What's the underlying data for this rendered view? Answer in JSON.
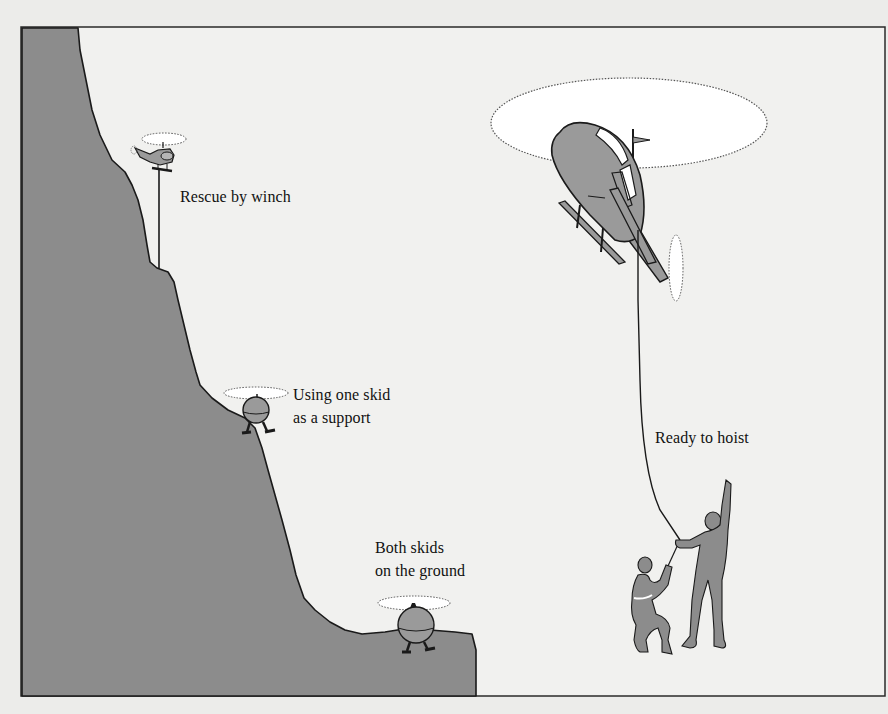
{
  "figure": {
    "colors": {
      "page_background": "#ececea",
      "panel_background": "#f1f1ef",
      "cliff_fill": "#8c8c8c",
      "outline": "#1a1a1a",
      "helicopter_fill": "#9a9a9a",
      "rotor_disc": "#ffffff"
    },
    "labels": {
      "winch": "Rescue by winch",
      "one_skid_line1": "Using one skid",
      "one_skid_line2": "as a support",
      "both_skids_line1": "Both skids",
      "both_skids_line2": "on the ground",
      "hoist": "Ready to hoist"
    },
    "scenes": [
      {
        "name": "rescue-by-winch",
        "label": "Rescue by winch"
      },
      {
        "name": "one-skid-support",
        "label": "Using one skid as a support"
      },
      {
        "name": "both-skids-ground",
        "label": "Both skids on the ground"
      },
      {
        "name": "ready-to-hoist",
        "label": "Ready to hoist"
      }
    ]
  }
}
